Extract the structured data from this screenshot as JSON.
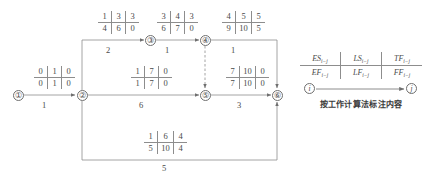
{
  "diagram": {
    "type": "activity-on-arrow-network",
    "nodes": [
      {
        "id": "n1",
        "label": "①",
        "x": 18,
        "y": 95
      },
      {
        "id": "n2",
        "label": "②",
        "x": 82,
        "y": 95
      },
      {
        "id": "n3",
        "label": "③",
        "x": 150,
        "y": 40
      },
      {
        "id": "n4",
        "label": "④",
        "x": 205,
        "y": 40
      },
      {
        "id": "n5",
        "label": "⑤",
        "x": 205,
        "y": 95
      },
      {
        "id": "n6",
        "label": "⑥",
        "x": 277,
        "y": 95
      }
    ],
    "activities": [
      {
        "name": "activity-1-2",
        "from": "①",
        "to": "②",
        "duration": "1",
        "es": "0",
        "ls": "1",
        "tf": "0",
        "ef": "0",
        "lf": "1",
        "ff": "0",
        "box_x": 34,
        "box_y": 66,
        "dur_x": 34,
        "dur_y": 101
      },
      {
        "name": "activity-2-3",
        "from": "②",
        "to": "③",
        "duration": "2",
        "es": "1",
        "ls": "3",
        "tf": "3",
        "ef": "4",
        "lf": "6",
        "ff": "0",
        "box_x": 98,
        "box_y": 11,
        "dur_x": 98,
        "dur_y": 46
      },
      {
        "name": "activity-3-4",
        "from": "③",
        "to": "④",
        "duration": "1",
        "es": "3",
        "ls": "4",
        "tf": "3",
        "ef": "6",
        "lf": "7",
        "ff": "0",
        "box_x": 157,
        "box_y": 11,
        "dur_x": 157,
        "dur_y": 46
      },
      {
        "name": "activity-4-6",
        "from": "④",
        "to": "⑥",
        "duration": "1",
        "es": "4",
        "ls": "5",
        "tf": "5",
        "ef": "9",
        "lf": "10",
        "ff": "5",
        "box_x": 224,
        "box_y": 11,
        "dur_x": 226,
        "dur_y": 46
      },
      {
        "name": "activity-2-5",
        "from": "②",
        "to": "⑤",
        "duration": "6",
        "es": "1",
        "ls": "7",
        "tf": "0",
        "ef": "1",
        "lf": "7",
        "ff": "0",
        "box_x": 131,
        "box_y": 66,
        "dur_x": 131,
        "dur_y": 101
      },
      {
        "name": "activity-5-6",
        "from": "⑤",
        "to": "⑥",
        "duration": "3",
        "es": "7",
        "ls": "10",
        "tf": "0",
        "ef": "7",
        "lf": "10",
        "ff": "0",
        "box_x": 228,
        "box_y": 66,
        "dur_x": 231,
        "dur_y": 101
      },
      {
        "name": "activity-2-6",
        "from": "②",
        "to": "⑥",
        "duration": "5",
        "es": "1",
        "ls": "6",
        "tf": "4",
        "ef": "5",
        "lf": "10",
        "ff": "4",
        "box_x": 146,
        "box_y": 131,
        "dur_x": 146,
        "dur_y": 166
      }
    ],
    "dummy_activity": {
      "name": "dummy-arrow-4-5",
      "from": "④",
      "to": "⑤"
    }
  },
  "legend": {
    "name": "notation-legend",
    "top_cells": [
      {
        "symbol": "ES",
        "sub": "i−j"
      },
      {
        "symbol": "LS",
        "sub": "i−j"
      },
      {
        "symbol": "TF",
        "sub": "i−j"
      }
    ],
    "bottom_cells": [
      {
        "symbol": "EF",
        "sub": "i−j"
      },
      {
        "symbol": "LF",
        "sub": "i−j"
      },
      {
        "symbol": "FF",
        "sub": "i−j"
      }
    ],
    "node_i": "i",
    "node_j": "j",
    "caption": "按工作计算法标注内容"
  },
  "colors": {
    "line": "#8d8d8d",
    "text": "#4a4a4a",
    "background": "#ffffff"
  }
}
